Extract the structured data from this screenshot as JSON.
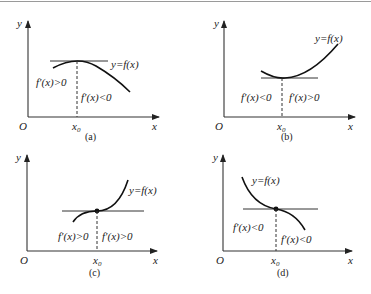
{
  "panels": [
    {
      "id": "a",
      "caption": "(a)",
      "origin_label": "O",
      "x_axis_label": "x",
      "y_axis_label": "y",
      "x0_label": "x",
      "x0_sub": "0",
      "curve_label": "y=f(x)",
      "left_label": "f′(x)>0",
      "right_label": "f′(x)<0",
      "description": "local maximum at x0, horizontal tangent"
    },
    {
      "id": "b",
      "caption": "(b)",
      "origin_label": "O",
      "x_axis_label": "x",
      "y_axis_label": "y",
      "x0_label": "x",
      "x0_sub": "0",
      "curve_label": "y=f(x)",
      "left_label": "f′(x)<0",
      "right_label": "f′(x)>0",
      "description": "local minimum at x0, horizontal tangent"
    },
    {
      "id": "c",
      "caption": "(c)",
      "origin_label": "O",
      "x_axis_label": "x",
      "y_axis_label": "y",
      "x0_label": "x",
      "x0_sub": "0",
      "curve_label": "y=f(x)",
      "left_label": "f′(x)>0",
      "right_label": "f′(x)>0",
      "description": "increasing inflection point at x0 with horizontal tangent"
    },
    {
      "id": "d",
      "caption": "(d)",
      "origin_label": "O",
      "x_axis_label": "x",
      "y_axis_label": "y",
      "x0_label": "x",
      "x0_sub": "0",
      "curve_label": "y=f(x)",
      "left_label": "f′(x)<0",
      "right_label": "f′(x)<0",
      "description": "decreasing inflection point at x0 with horizontal tangent"
    }
  ]
}
